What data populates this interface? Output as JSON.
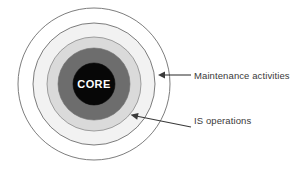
{
  "diagram": {
    "title": "",
    "type": "concentric-circles",
    "center": {
      "x": 94,
      "y": 84
    },
    "rings": [
      {
        "name": "outer-ring",
        "label": "Maintenance activities",
        "radius": 77,
        "fill": "#ffffff",
        "stroke": "#6b6b6b"
      },
      {
        "name": "middle-ring",
        "label": "IS operations",
        "radius": 60,
        "fill": "#f0f0f0",
        "stroke": "#6b6b6b"
      },
      {
        "name": "inner-ring",
        "label": "",
        "radius": 46,
        "fill": "#d9d9d9",
        "stroke": "#6b6b6b"
      },
      {
        "name": "core-ring",
        "label": "",
        "radius": 36,
        "fill": "#6d6d6d",
        "stroke": "#6d6d6d"
      },
      {
        "name": "core-circle",
        "label": "CORE",
        "radius": 21,
        "fill": "#050505",
        "stroke": "#050505"
      }
    ],
    "core_label": "CORE",
    "callouts": [
      {
        "name": "maintenance-activities",
        "text": "Maintenance activities",
        "arrow_from": {
          "x": 191,
          "y": 75
        },
        "arrow_to": {
          "x": 159,
          "y": 75
        },
        "color": "#3a3a3a"
      },
      {
        "name": "is-operations",
        "text": "IS operations",
        "arrow_from": {
          "x": 191,
          "y": 127
        },
        "arrow_to": {
          "x": 130,
          "y": 114
        },
        "color": "#3a3a3a"
      }
    ],
    "colors": {
      "background": "#ffffff",
      "outline": "#6b6b6b",
      "band_white": "#ffffff",
      "band_light": "#f0f0f0",
      "band_mid": "#d9d9d9",
      "band_dark": "#6d6d6d",
      "core": "#050505",
      "core_text": "#ffffff",
      "label_text": "#3a3a3a"
    }
  }
}
